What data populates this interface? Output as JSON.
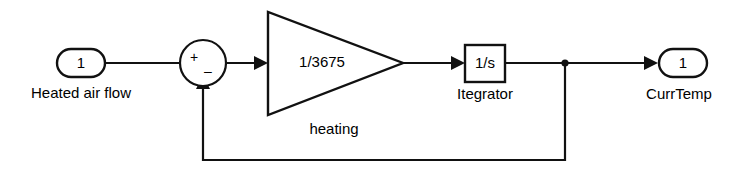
{
  "diagram": {
    "colors": {
      "background": "#ffffff",
      "line": "#111111",
      "block_fill": "#ffffff",
      "text": "#000000"
    },
    "blocks": {
      "input_port": {
        "type": "inport",
        "value": "1",
        "caption": "Heated air flow"
      },
      "sum": {
        "type": "sum-junction",
        "shape": "circle",
        "plus_sign": "+",
        "minus_sign": "–",
        "caption": ""
      },
      "gain": {
        "type": "gain-triangle",
        "value": "1/3675",
        "caption": "heating"
      },
      "integrator": {
        "type": "transfer-function",
        "value": "1/s",
        "caption": "Itegrator"
      },
      "output_port": {
        "type": "outport",
        "value": "1",
        "caption": "CurrTemp"
      }
    },
    "signals": [
      {
        "name": "input-to-sum",
        "from": "input_port",
        "to": "sum"
      },
      {
        "name": "sum-to-gain",
        "from": "sum",
        "to": "gain"
      },
      {
        "name": "gain-to-integrator",
        "from": "gain",
        "to": "integrator"
      },
      {
        "name": "integrator-to-output",
        "from": "integrator",
        "to": "output_port"
      },
      {
        "name": "feedback-loop",
        "from": "integrator",
        "to": "sum"
      }
    ]
  }
}
